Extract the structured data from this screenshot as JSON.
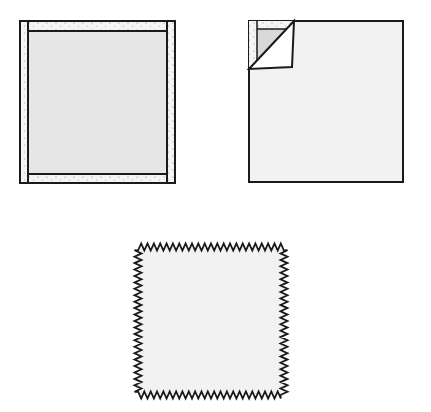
{
  "figure": {
    "colors": {
      "background": "#ffffff",
      "fabric_fill": "#f2f2f2",
      "inner_fill": "#e6e6e6",
      "stroke": "#1a1a1a",
      "speckle": "#9a9a9a"
    },
    "items": [
      {
        "id": "bound-square",
        "label": "Square with bound edges (folded border strips)"
      },
      {
        "id": "folded-corner-square",
        "label": "Square with corner folded back diagonally"
      },
      {
        "id": "pinked-square",
        "label": "Square with pinked (zigzag) edges"
      }
    ]
  }
}
